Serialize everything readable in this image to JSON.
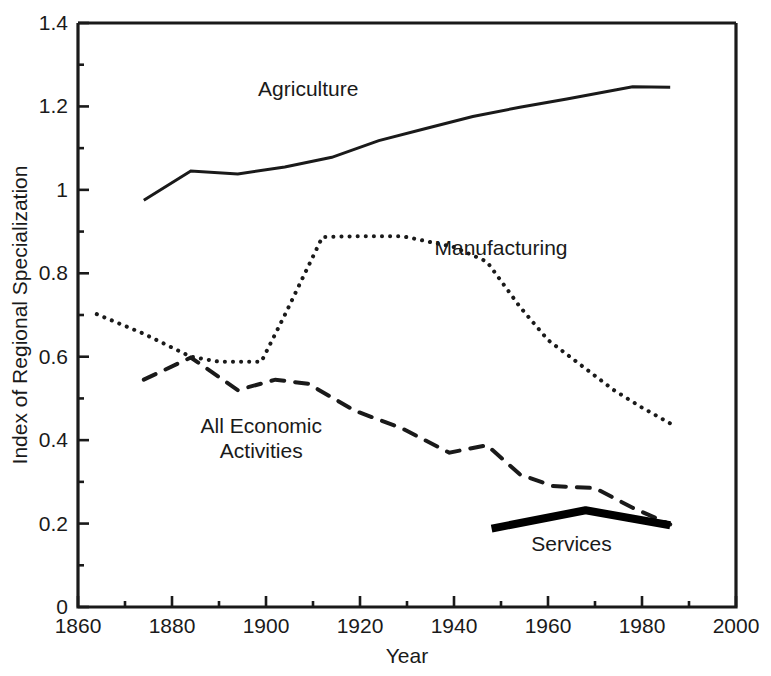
{
  "chart_data": {
    "type": "line",
    "title": "",
    "subtitle": "",
    "xlabel": "Year",
    "ylabel": "Index of Regional Specialization",
    "xlim": [
      1860,
      2000
    ],
    "ylim": [
      0,
      1.4
    ],
    "x_ticks": [
      1860,
      1880,
      1900,
      1920,
      1940,
      1960,
      1980,
      2000
    ],
    "x_tick_labels": [
      "1860",
      "1880",
      "1900",
      "1920",
      "1940",
      "1960",
      "1980",
      "2000"
    ],
    "x_minor_tick_step": 10,
    "y_ticks": [
      0,
      0.2,
      0.4,
      0.6,
      0.8,
      1,
      1.2,
      1.4
    ],
    "y_tick_labels": [
      "0",
      "0.2",
      "0.4",
      "0.6",
      "0.8",
      "1",
      "1.2",
      "1.4"
    ],
    "y_minor_tick_step": 0.1,
    "grid": false,
    "legend": "inline-annotations",
    "legend_position": "inline",
    "series": [
      {
        "name": "Agriculture",
        "style": "solid",
        "label_x": 1909,
        "label_y": 1.225,
        "points": [
          [
            1874,
            0.975
          ],
          [
            1884,
            1.045
          ],
          [
            1894,
            1.038
          ],
          [
            1904,
            1.055
          ],
          [
            1914,
            1.078
          ],
          [
            1924,
            1.118
          ],
          [
            1934,
            1.147
          ],
          [
            1944,
            1.176
          ],
          [
            1954,
            1.198
          ],
          [
            1964,
            1.218
          ],
          [
            1978,
            1.247
          ],
          [
            1986,
            1.246
          ]
        ]
      },
      {
        "name": "Manufacturing",
        "style": "dotted",
        "label_x": 1950,
        "label_y": 0.845,
        "points": [
          [
            1864,
            0.702
          ],
          [
            1874,
            0.655
          ],
          [
            1884,
            0.6
          ],
          [
            1890,
            0.588
          ],
          [
            1899,
            0.588
          ],
          [
            1904,
            0.7
          ],
          [
            1912,
            0.887
          ],
          [
            1920,
            0.889
          ],
          [
            1929,
            0.889
          ],
          [
            1940,
            0.863
          ],
          [
            1947,
            0.828
          ],
          [
            1954,
            0.72
          ],
          [
            1960,
            0.64
          ],
          [
            1967,
            0.58
          ],
          [
            1974,
            0.52
          ],
          [
            1980,
            0.478
          ],
          [
            1986,
            0.44
          ]
        ]
      },
      {
        "name": "All Economic Activities",
        "style": "dashed",
        "label_x": 1899,
        "label_y": 0.418,
        "label_lines": [
          "All Economic",
          "Activities"
        ],
        "points": [
          [
            1874,
            0.545
          ],
          [
            1884,
            0.598
          ],
          [
            1894,
            0.52
          ],
          [
            1902,
            0.545
          ],
          [
            1909,
            0.535
          ],
          [
            1919,
            0.47
          ],
          [
            1929,
            0.428
          ],
          [
            1939,
            0.37
          ],
          [
            1947,
            0.388
          ],
          [
            1954,
            0.318
          ],
          [
            1961,
            0.29
          ],
          [
            1970,
            0.285
          ],
          [
            1978,
            0.238
          ],
          [
            1986,
            0.198
          ]
        ]
      },
      {
        "name": "Services",
        "style": "thick-solid",
        "label_x": 1965,
        "label_y": 0.135,
        "points": [
          [
            1948,
            0.188
          ],
          [
            1968,
            0.232
          ],
          [
            1986,
            0.196
          ]
        ]
      }
    ],
    "colors": {
      "axis": "#1a1a1a",
      "agriculture": "#1a1a1a",
      "manufacturing": "#1a1a1a",
      "all_economic_activities": "#1a1a1a",
      "services": "#000000",
      "background": "#ffffff"
    }
  }
}
